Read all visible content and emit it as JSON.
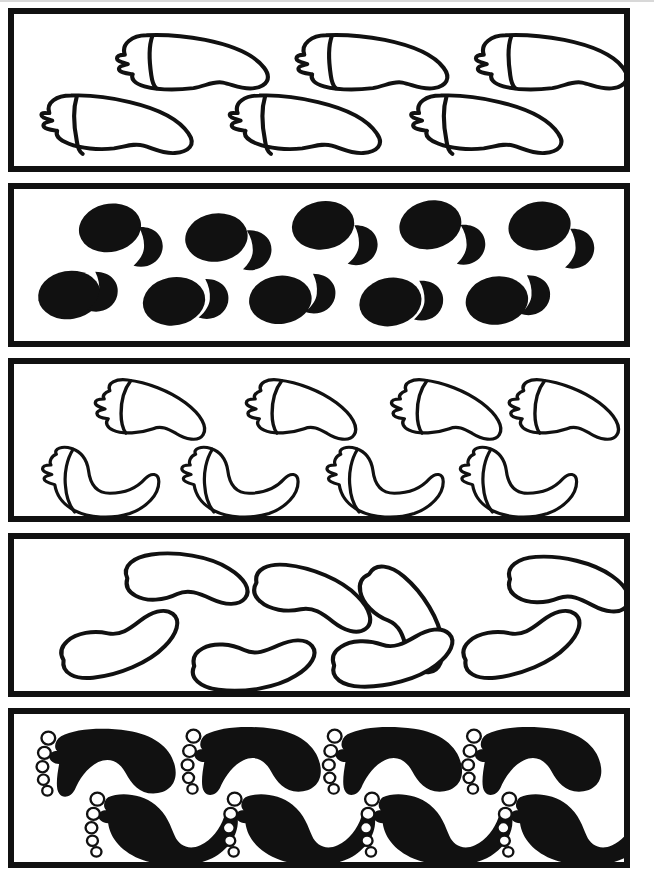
{
  "figure": {
    "canvas": {
      "width": 654,
      "height": 871,
      "background": "#ffffff"
    },
    "ink_color": "#111111",
    "paper_color": "#ffffff",
    "border": {
      "color": "#111111",
      "width_px": 6
    },
    "artifact": {
      "name": "scan-edge-streak",
      "color": "#d8d8d8",
      "height_px": 2
    }
  },
  "panels": [
    {
      "id": "panel-1",
      "index": 1,
      "name": "outline-lobed-bean-large",
      "label": "Panel 1",
      "motif": "outline-bean-with-ridged-cap",
      "fill": "outline",
      "bounds": {
        "x": 8,
        "y": 8,
        "width": 622,
        "height": 164
      },
      "rows": [
        {
          "count": 3,
          "orientation": "cap-left-tail-right"
        },
        {
          "count": 3,
          "orientation": "cap-left-tail-right"
        }
      ],
      "shape_count": 6
    },
    {
      "id": "panel-2",
      "index": 2,
      "name": "solid-oval-with-crescent",
      "label": "Panel 2",
      "motif": "filled-oval-paired-with-half-disc",
      "fill": "solid",
      "bounds": {
        "x": 8,
        "y": 183,
        "width": 622,
        "height": 164
      },
      "rows": [
        {
          "count": 5,
          "orientation": "oval-left-crescent-right"
        },
        {
          "count": 5,
          "orientation": "oval-left-crescent-right"
        }
      ],
      "shape_count": 10
    },
    {
      "id": "panel-3",
      "index": 3,
      "name": "outline-lobed-bean-small",
      "label": "Panel 3",
      "motif": "outline-bean-with-ridged-cap",
      "fill": "outline",
      "bounds": {
        "x": 8,
        "y": 358,
        "width": 622,
        "height": 164
      },
      "rows": [
        {
          "count": 4,
          "orientation": "cap-left-tail-right"
        },
        {
          "count": 4,
          "orientation": "cap-left-tail-right"
        }
      ],
      "shape_count": 8
    },
    {
      "id": "panel-4",
      "index": 4,
      "name": "outline-plain-kidney",
      "label": "Panel 4",
      "motif": "plain-kidney-bean-outline",
      "fill": "outline",
      "bounds": {
        "x": 8,
        "y": 533,
        "width": 622,
        "height": 164
      },
      "rows": [
        {
          "count": 4,
          "orientation": "bean-concave-down"
        },
        {
          "count": 4,
          "orientation": "bean-concave-up"
        }
      ],
      "shape_count": 8
    },
    {
      "id": "panel-5",
      "index": 5,
      "name": "solid-footprint-five-toes",
      "label": "Panel 5",
      "motif": "filled-footprint-with-five-toe-holes",
      "fill": "solid",
      "bounds": {
        "x": 8,
        "y": 708,
        "width": 622,
        "height": 160
      },
      "rows": [
        {
          "count": 4,
          "orientation": "toes-left-arch-down"
        },
        {
          "count": 4,
          "orientation": "toes-left-arch-up"
        }
      ],
      "shape_count": 8,
      "toes_per_shape": 5
    }
  ],
  "icons": {
    "bean": "bean-shape-icon",
    "oval": "oval-shape-icon",
    "crescent": "crescent-shape-icon",
    "footprint": "footprint-shape-icon"
  }
}
